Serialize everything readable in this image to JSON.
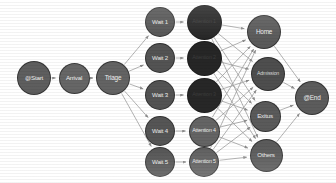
{
  "diagram": {
    "type": "directed-graph",
    "width": 336,
    "height": 183,
    "background": "#ffffff",
    "edge_color": "#9a9a9a",
    "arrow_color": "#8d8d8d"
  },
  "nodes": [
    {
      "id": "start",
      "label": "@Start",
      "x": 34,
      "y": 78,
      "r": 17,
      "fill": "#5e5e5e",
      "text": "#efefef",
      "font": 6.2
    },
    {
      "id": "arrival",
      "label": "Arrival",
      "x": 74,
      "y": 78,
      "r": 15.5,
      "fill": "#666666",
      "text": "#f0f0f0",
      "font": 6.2
    },
    {
      "id": "triage",
      "label": "Triage",
      "x": 113,
      "y": 78,
      "r": 17,
      "fill": "#636363",
      "text": "#f0f0f0",
      "font": 6.4
    },
    {
      "id": "wait1",
      "label": "Wait 1",
      "x": 160,
      "y": 22,
      "r": 15,
      "fill": "#555555",
      "text": "#ededed",
      "font": 6.1
    },
    {
      "id": "wait2",
      "label": "Wait 2",
      "x": 160,
      "y": 58,
      "r": 15,
      "fill": "#535353",
      "text": "#ededed",
      "font": 6.1
    },
    {
      "id": "wait3",
      "label": "Wait 3",
      "x": 160,
      "y": 95,
      "r": 15,
      "fill": "#535353",
      "text": "#ededed",
      "font": 6.1
    },
    {
      "id": "wait4",
      "label": "Wait 4",
      "x": 160,
      "y": 131,
      "r": 15,
      "fill": "#555555",
      "text": "#ededed",
      "font": 6.1
    },
    {
      "id": "wait5",
      "label": "Wait 5",
      "x": 160,
      "y": 162,
      "r": 15,
      "fill": "#545454",
      "text": "#ededed",
      "font": 6.1
    },
    {
      "id": "att1",
      "label": "Attention 1",
      "x": 204,
      "y": 22,
      "r": 17.5,
      "fill": "#262626",
      "text": "#3c3c3c",
      "font": 5.4
    },
    {
      "id": "att2",
      "label": "Attention 2",
      "x": 204,
      "y": 58,
      "r": 17.5,
      "fill": "#262626",
      "text": "#3c3c3c",
      "font": 5.4
    },
    {
      "id": "att3",
      "label": "Attention 3",
      "x": 204,
      "y": 95,
      "r": 17.5,
      "fill": "#272727",
      "text": "#3c3c3c",
      "font": 5.4
    },
    {
      "id": "att4",
      "label": "Attention 4",
      "x": 204,
      "y": 131,
      "r": 15.5,
      "fill": "#646464",
      "text": "#ededed",
      "font": 5.4
    },
    {
      "id": "att5",
      "label": "Attention 5",
      "x": 204,
      "y": 162,
      "r": 15,
      "fill": "#5f5f5f",
      "text": "#ededed",
      "font": 5.4
    },
    {
      "id": "home",
      "label": "Home",
      "x": 264,
      "y": 32,
      "r": 17,
      "fill": "#5a5a5a",
      "text": "#f0f0f0",
      "font": 6.4
    },
    {
      "id": "admission",
      "label": "Admission",
      "x": 268,
      "y": 74,
      "r": 17,
      "fill": "#4e4e4e",
      "text": "#d8d8d8",
      "font": 5.2
    },
    {
      "id": "exitus",
      "label": "Exitus",
      "x": 265,
      "y": 116,
      "r": 15.5,
      "fill": "#5a5a5a",
      "text": "#efefef",
      "font": 6.2
    },
    {
      "id": "others",
      "label": "Others",
      "x": 266,
      "y": 155,
      "r": 16.5,
      "fill": "#5b5b5b",
      "text": "#efefef",
      "font": 6.2
    },
    {
      "id": "end",
      "label": "@End",
      "x": 312,
      "y": 98,
      "r": 17,
      "fill": "#5c5c5c",
      "text": "#efefef",
      "font": 6.4
    }
  ],
  "edges": [
    {
      "from": "start",
      "to": "arrival"
    },
    {
      "from": "arrival",
      "to": "triage"
    },
    {
      "from": "triage",
      "to": "wait1"
    },
    {
      "from": "triage",
      "to": "wait2"
    },
    {
      "from": "triage",
      "to": "wait3"
    },
    {
      "from": "triage",
      "to": "wait4"
    },
    {
      "from": "triage",
      "to": "wait5"
    },
    {
      "from": "wait1",
      "to": "att1"
    },
    {
      "from": "wait2",
      "to": "att2"
    },
    {
      "from": "wait3",
      "to": "att3"
    },
    {
      "from": "wait4",
      "to": "att4"
    },
    {
      "from": "wait5",
      "to": "att5"
    },
    {
      "from": "att1",
      "to": "home"
    },
    {
      "from": "att1",
      "to": "admission"
    },
    {
      "from": "att1",
      "to": "exitus"
    },
    {
      "from": "att1",
      "to": "others"
    },
    {
      "from": "att2",
      "to": "home"
    },
    {
      "from": "att2",
      "to": "admission"
    },
    {
      "from": "att2",
      "to": "exitus"
    },
    {
      "from": "att2",
      "to": "others"
    },
    {
      "from": "att3",
      "to": "home"
    },
    {
      "from": "att3",
      "to": "admission"
    },
    {
      "from": "att3",
      "to": "exitus"
    },
    {
      "from": "att3",
      "to": "others"
    },
    {
      "from": "att4",
      "to": "home"
    },
    {
      "from": "att4",
      "to": "admission"
    },
    {
      "from": "att4",
      "to": "exitus"
    },
    {
      "from": "att4",
      "to": "others"
    },
    {
      "from": "att5",
      "to": "home"
    },
    {
      "from": "att5",
      "to": "admission"
    },
    {
      "from": "att5",
      "to": "exitus"
    },
    {
      "from": "att5",
      "to": "others"
    },
    {
      "from": "home",
      "to": "end"
    },
    {
      "from": "admission",
      "to": "end"
    },
    {
      "from": "exitus",
      "to": "end"
    },
    {
      "from": "others",
      "to": "end"
    }
  ]
}
